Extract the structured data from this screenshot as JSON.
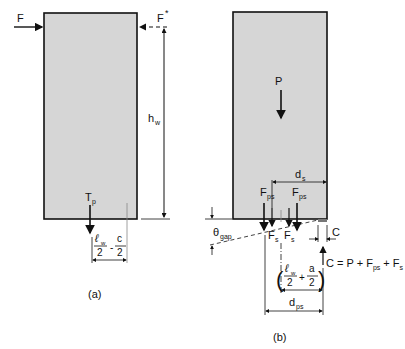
{
  "figure_a": {
    "caption": "(a)",
    "force_left": "F",
    "force_right": "F",
    "force_right_sup": "*",
    "height_label": "h",
    "height_sub": "w",
    "tendon_label": "T",
    "tendon_sub": "p",
    "dim_num1": "ℓ",
    "dim_num1_sub": "w",
    "dim_den1": "2",
    "dim_minus": "-",
    "dim_num2": "c",
    "dim_den2": "2"
  },
  "figure_b": {
    "caption": "(b)",
    "axial_label": "P",
    "ds_label": "d",
    "ds_sub": "s",
    "fps_label": "F",
    "fps_sub": "ps",
    "fs_label": "F",
    "fs_sub": "s",
    "theta_label": "θ",
    "theta_sub": "gap",
    "c_label": "C",
    "compression_eq": "C = P + F",
    "compression_eq_sub1": "ps",
    "compression_eq_mid": " + F",
    "compression_eq_sub2": "s",
    "dim2_num1": "ℓ",
    "dim2_num1_sub": "w",
    "dim2_den1": "2",
    "dim2_plus": "+",
    "dim2_num2": "a",
    "dim2_den2": "2",
    "dps_label": "d",
    "dps_sub": "ps"
  },
  "colors": {
    "wall_fill": "#d6d6d6",
    "line": "#111111"
  }
}
